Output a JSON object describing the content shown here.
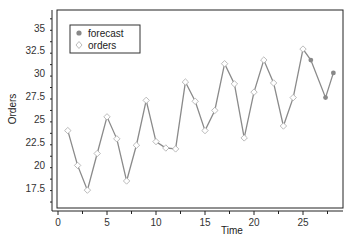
{
  "chart_data": {
    "type": "line",
    "title": "",
    "xlabel": "Time",
    "ylabel": "Orders",
    "xlim": [
      0,
      29
    ],
    "ylim": [
      16,
      37
    ],
    "xticks": [
      0,
      5,
      10,
      15,
      20,
      25
    ],
    "yticks": [
      17.5,
      20,
      22.5,
      25,
      27.5,
      30,
      32.5,
      35
    ],
    "xtick_labels": [
      "0",
      "5",
      "10",
      "15",
      "20",
      "25"
    ],
    "ytick_labels": [
      "17.5",
      "20",
      "22.5",
      "25",
      "27.5",
      "30",
      "32.5",
      "35"
    ],
    "grid": false,
    "legend_position": "upper left",
    "series": [
      {
        "name": "orders",
        "marker": "open-diamond",
        "color": "#999999",
        "x": [
          1,
          2,
          3,
          4,
          5,
          6,
          7,
          8,
          9,
          10,
          11,
          12,
          13,
          14,
          15,
          16,
          17,
          18,
          19,
          20,
          21,
          22,
          23,
          24,
          25
        ],
        "values": [
          23.8,
          20.0,
          17.3,
          21.3,
          25.3,
          22.9,
          18.3,
          22.2,
          27.1,
          22.6,
          21.9,
          21.8,
          29.1,
          27.0,
          23.8,
          26.0,
          31.1,
          28.9,
          23.0,
          28.0,
          31.5,
          29.0,
          24.3,
          27.4,
          32.7
        ]
      },
      {
        "name": "forecast",
        "marker": "filled-circle",
        "color": "#888888",
        "x": [
          25,
          25.8,
          27.3,
          28.1
        ],
        "values": [
          32.7,
          31.5,
          27.4,
          30.1
        ]
      }
    ]
  },
  "legend": {
    "items": [
      {
        "label": "forecast",
        "marker": "filled-circle"
      },
      {
        "label": "orders",
        "marker": "open-diamond"
      }
    ]
  }
}
